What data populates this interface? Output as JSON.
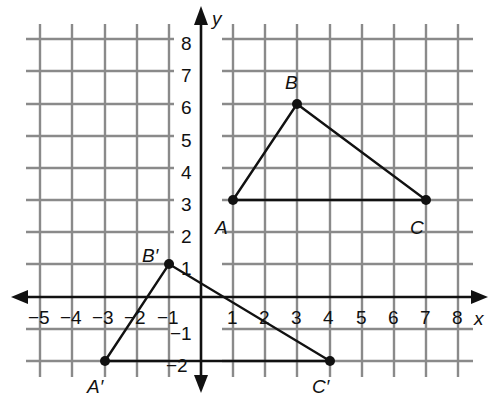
{
  "diagram": {
    "type": "coordinate-plane-transformation",
    "axes": {
      "x_label": "x",
      "y_label": "y",
      "x_ticks": [
        "−5",
        "−4",
        "−3",
        "−2",
        "−1",
        "1",
        "2",
        "3",
        "4",
        "5",
        "6",
        "7",
        "8"
      ],
      "y_ticks": [
        "8",
        "7",
        "6",
        "5",
        "4",
        "3",
        "2",
        "1",
        "−1",
        "−2"
      ]
    },
    "triangles": [
      {
        "name": "ABC",
        "vertices": [
          {
            "label": "A",
            "x": 1,
            "y": 3
          },
          {
            "label": "B",
            "x": 3,
            "y": 6
          },
          {
            "label": "C",
            "x": 7,
            "y": 3
          }
        ]
      },
      {
        "name": "A'B'C'",
        "vertices": [
          {
            "label": "A′",
            "x": -3,
            "y": -2
          },
          {
            "label": "B′",
            "x": -1,
            "y": 1
          },
          {
            "label": "C′",
            "x": 4,
            "y": -2
          }
        ]
      }
    ]
  }
}
